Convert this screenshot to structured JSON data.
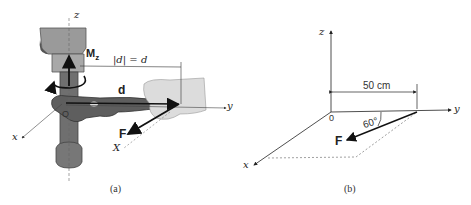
{
  "panel_a": {
    "caption": "(a)",
    "axes": {
      "x": "x",
      "y": "y",
      "z": "z",
      "X": "X"
    },
    "origin_label": "O",
    "moment_label": "M",
    "moment_subscript": "z",
    "position_vector_label": "d",
    "magnitude_label": "|d| = d",
    "force_label": "F"
  },
  "panel_b": {
    "caption": "(b)",
    "axes": {
      "x": "x",
      "y": "y",
      "z": "z"
    },
    "origin_label": "0",
    "distance_label": "50 cm",
    "angle_label": "60°",
    "force_label": "F"
  },
  "colors": {
    "line": "#222222",
    "dotted": "#777777",
    "photo_metal": "#8a8a8a",
    "photo_hand": "#d8d8d8"
  }
}
